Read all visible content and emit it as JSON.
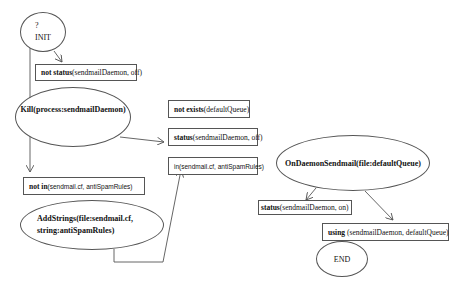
{
  "diagram": {
    "init": {
      "line1": "?",
      "line2": "INIT"
    },
    "nodes": {
      "not_status_off": {
        "keyword": "not status",
        "args": "(sendmailDaemon, off)"
      },
      "kill": {
        "label": "Kill(process:sendmailDaemon)"
      },
      "not_exists_queue": {
        "keyword": "not exists",
        "args": "(defaultQueue)"
      },
      "status_off": {
        "keyword": "status",
        "args": "(sendmailDaemon, off)"
      },
      "in_rules": {
        "keyword": "in",
        "args": "(sendmail.cf, antiSpamRules)"
      },
      "not_in_rules": {
        "keyword": "not in",
        "args": "(sendmail.cf, antiSpamRules)"
      },
      "addstrings": {
        "line1": "AddStrings(file:sendmail.cf,",
        "line2": "string:antiSpamRules)"
      },
      "on_daemon": {
        "label": "OnDaemonSendmail(file:defaultQueue)"
      },
      "status_on": {
        "keyword": "status",
        "args": "(sendmailDaemon, on)"
      },
      "using": {
        "keyword": "using",
        "args": " (sendmailDaemon, defaultQueue)"
      },
      "end": {
        "label": "END"
      }
    },
    "colors": {
      "stroke": "#555555",
      "text": "#111111",
      "background": "#ffffff"
    }
  }
}
